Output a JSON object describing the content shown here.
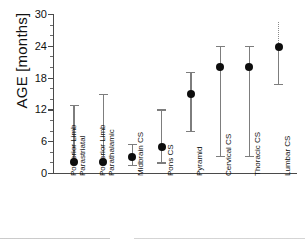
{
  "chart_data": {
    "type": "scatter",
    "title": "",
    "xlabel": "",
    "ylabel": "AGE [months]",
    "ylim": [
      0,
      30
    ],
    "ytick_values": [
      0,
      6,
      12,
      18,
      24,
      30
    ],
    "ytick_labels": [
      "0",
      "6",
      "12",
      "18",
      "24",
      "30"
    ],
    "yminor_step": 2,
    "grid": false,
    "legend": null,
    "categories": [
      "Posterior Limb Parastriatal",
      "Posterior Limb Parathalamic",
      "Midbrain CS",
      "Pons CS",
      "Pyramid",
      "Cervical CS",
      "Thoracic CS",
      "Lumbar CS"
    ],
    "category_label_lines": [
      [
        "Posterior Limb",
        "Parastriatal"
      ],
      [
        "Posterior Limb",
        "Parathalamic"
      ],
      [
        "Midbrain CS"
      ],
      [
        "Pons CS"
      ],
      [
        "Pyramid"
      ],
      [
        "Cervical CS"
      ],
      [
        "Thoracic CS"
      ],
      [
        "Lumbar CS"
      ]
    ],
    "values": [
      2.0,
      2.0,
      3.0,
      5.0,
      15.0,
      20.0,
      20.0,
      23.8
    ],
    "error_low": [
      2.0,
      2.0,
      1.6,
      2.0,
      8.0,
      3.2,
      3.2,
      16.8
    ],
    "error_high": [
      12.8,
      15.0,
      5.5,
      12.0,
      19.0,
      24.0,
      24.0,
      28.5
    ],
    "upper_whisker_style": [
      "solid",
      "solid",
      "solid",
      "solid",
      "solid",
      "solid",
      "solid",
      "dotted"
    ],
    "lower_whisker_style": [
      "solid",
      "solid",
      "solid",
      "solid",
      "solid",
      "solid",
      "solid",
      "solid"
    ],
    "marker": "filled-circle",
    "marker_color": "#0d0d0d",
    "whisker_color": "#7d7d7d",
    "axis_color": "#4a4a4a"
  }
}
